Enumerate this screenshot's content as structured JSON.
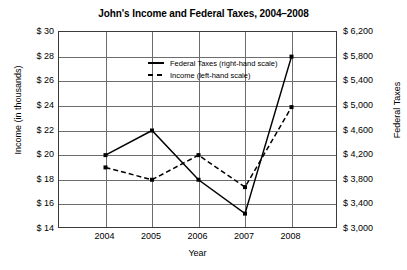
{
  "chart_data": {
    "type": "line",
    "title": "John's Income and Federal Taxes, 2004–2008",
    "xlabel": "Year",
    "ylabel": "Income (in thousands)",
    "ylabel_right": "Federal Taxes",
    "categories": [
      "2004",
      "2005",
      "2006",
      "2007",
      "2008"
    ],
    "x": [
      2004,
      2005,
      2006,
      2007,
      2008
    ],
    "grid": true,
    "legend_position": "upper-center",
    "ylim": [
      14,
      30
    ],
    "yticks": [
      "$ 30",
      "$ 28",
      "$ 26",
      "$ 24",
      "$ 22",
      "$ 20",
      "$ 18",
      "$ 16",
      "$ 14"
    ],
    "ytick_values": [
      30,
      28,
      26,
      24,
      22,
      20,
      18,
      16,
      14
    ],
    "ylim_right": [
      3000,
      6200
    ],
    "yticks_right": [
      "$ 6,200",
      "$ 5,800",
      "$ 5,400",
      "$ 5,000",
      "$ 4,600",
      "$ 4,200",
      "$ 3,800",
      "$ 3,400",
      "$ 3,000"
    ],
    "ytick_values_right": [
      6200,
      5800,
      5400,
      5000,
      4600,
      4200,
      3800,
      3400,
      3000
    ],
    "series": [
      {
        "name": "Federal Taxes (right-hand scale)",
        "axis": "right",
        "style": "solid",
        "marker": "square",
        "values": [
          4200,
          4600,
          3800,
          3250,
          5800
        ],
        "values_on_left_scale": [
          20.0,
          22.0,
          18.0,
          14.9,
          27.9
        ]
      },
      {
        "name": "Income (left-hand scale)",
        "axis": "left",
        "style": "dashed",
        "marker": "square",
        "values": [
          19.0,
          18.0,
          20.0,
          17.4,
          23.9
        ]
      }
    ]
  },
  "legend": {
    "items": [
      {
        "label": "Federal Taxes (right-hand scale)",
        "style": "solid"
      },
      {
        "label": "Income (left-hand scale)",
        "style": "dashed"
      }
    ]
  }
}
